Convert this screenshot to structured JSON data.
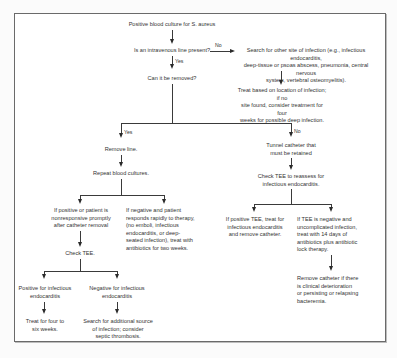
{
  "flowchart": {
    "start": "Positive blood culture for S. aureus",
    "q_iv_line": "Is an intravenous line present?",
    "label_no_1": "No",
    "label_yes_1": "Yes",
    "search_other_site": "Search for other site of infection (e.g., infectious endocarditis,\ndeep-tissue or psoas abscess, pneumonia, central nervous\nsystem, vertebral osteomyelitis).",
    "treat_based_location": "Treat based on location of infection; if no\nsite found, consider treatment for four\nweeks for possible deep infection.",
    "q_can_remove": "Can it be removed?",
    "label_yes_2": "Yes",
    "label_no_2": "No",
    "remove_line": "Remove line.",
    "repeat_cultures": "Repeat blood cultures.",
    "tunnel_catheter": "Tunnel catheter that\nmust be retained",
    "check_tee_reassess": "Check TEE to reassess for\ninfectious endocarditis.",
    "positive_nonresponsive": "If positive or patient is\nnonresponsive promptly\nafter catheter removal",
    "negative_responds": "If negative and patient\nresponds rapidly to therapy,\n(no emboli, infectious\nendocarditis, or deep-\nseated infection), treat with\nantibiotics for two weeks.",
    "check_tee": "Check TEE.",
    "positive_tee_treat": "If positive TEE, treat for\ninfectious endocarditis\nand remove catheter.",
    "negative_tee_uncomplicated": "If TEE is negative and\nuncomplicated infection,\ntreat with 14 days of\nantibiotics plus antibiotic\nlock therapy.",
    "positive_ie": "Positive for infectious\nendocarditis",
    "negative_ie": "Negative for infectious\nendocarditis",
    "treat_four_six": "Treat for four to\nsix weeks.",
    "search_additional": "Search for additional source\nof infection; consider\nseptic thrombosis.",
    "remove_catheter_if": "Remove catheter if there\nis clinical deterioration\nor persisting or relapsing\nbacteremia."
  }
}
